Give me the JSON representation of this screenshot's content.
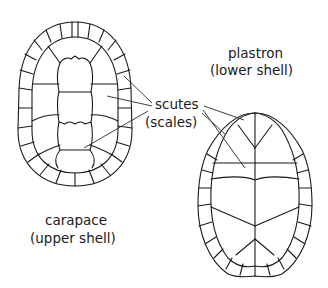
{
  "diagram": {
    "carapace": {
      "label": "carapace",
      "sublabel": "(upper shell)"
    },
    "plastron": {
      "label": "plastron",
      "sublabel": "(lower shell)"
    },
    "scutes": {
      "label": "scutes",
      "sublabel": "(scales)"
    },
    "colors": {
      "line": "#1a1a1a",
      "background": "#ffffff"
    }
  }
}
